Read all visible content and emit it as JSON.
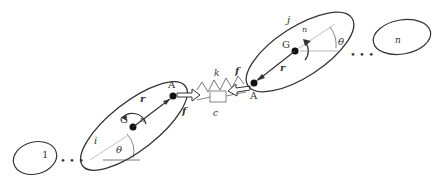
{
  "diagram": {
    "title": "",
    "bodies": [
      {
        "id": "body-1",
        "label": "1"
      },
      {
        "id": "body-i",
        "label": "i",
        "center_label": "G",
        "center_sub": "i",
        "anchor_label": "A",
        "anchor_sub": "i",
        "angle_label": "θ",
        "angle_sub": "i",
        "moment_label": "n",
        "moment_sub": "(i)i",
        "vector_label": "r",
        "vector_sub": "GiAi"
      },
      {
        "id": "body-j",
        "label": "j",
        "center_label": "G",
        "center_sub": "j",
        "anchor_label": "A",
        "anchor_sub": "j",
        "angle_label": "θ",
        "angle_sub": "j",
        "moment_label": "n",
        "moment_sub": "(j)j",
        "vector_label": "r",
        "vector_sub": "GjAj"
      },
      {
        "id": "body-nb",
        "label": "n",
        "label_sub": "b"
      }
    ],
    "connection": {
      "spring_label": "k",
      "spring_sub": "(ij)",
      "damper_label": "c",
      "damper_sub": "(ij)",
      "force_i_label": "f",
      "force_i_sub": "(i)i",
      "force_j_label": "f",
      "force_j_sub": "(j)j"
    },
    "ellipsis": "• • •",
    "colors": {
      "stroke": "#333333",
      "thin": "#888888"
    }
  }
}
